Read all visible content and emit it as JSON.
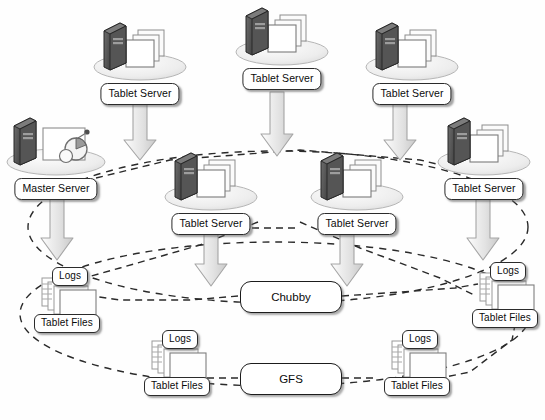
{
  "diagram": {
    "palette": {
      "arrow_fill": "#e6e6e6",
      "arrow_edge": "#9a9a9a",
      "dash_stroke": "#2a2a2a",
      "box_border": "#1c1c1c",
      "box_fill": "#ffffff",
      "tower_dark": "#3a3a3a",
      "ellipse_base": "#e9e9e9",
      "page_fill": "#fdfdfd",
      "page_edge": "#8d8d8d"
    },
    "nodes": [
      {
        "id": "ts1",
        "label": "Tablet Server",
        "icon": "tablet-server-icon",
        "x": 86,
        "y": 17,
        "kind": "server"
      },
      {
        "id": "ts2",
        "label": "Tablet Server",
        "icon": "tablet-server-icon",
        "x": 228,
        "y": 2,
        "kind": "server"
      },
      {
        "id": "ts3",
        "label": "Tablet Server",
        "icon": "tablet-server-icon",
        "x": 358,
        "y": 17,
        "kind": "server"
      },
      {
        "id": "ms",
        "label": "Master Server",
        "icon": "master-server-icon",
        "x": 0,
        "y": 112,
        "kind": "master"
      },
      {
        "id": "ts4",
        "label": "Tablet Server",
        "icon": "tablet-server-icon",
        "x": 157,
        "y": 147,
        "kind": "server"
      },
      {
        "id": "ts5",
        "label": "Tablet Server",
        "icon": "tablet-server-icon",
        "x": 303,
        "y": 147,
        "kind": "server"
      },
      {
        "id": "ts6",
        "label": "Tablet Server",
        "icon": "tablet-server-icon",
        "x": 430,
        "y": 112,
        "kind": "server"
      },
      {
        "id": "tf1",
        "label": "Tablet Files",
        "sublabel": "Logs",
        "icon": "tablet-files-icon",
        "x": 30,
        "y": 267,
        "kind": "files"
      },
      {
        "id": "tf2",
        "label": "Tablet Files",
        "sublabel": "Logs",
        "icon": "tablet-files-icon",
        "x": 140,
        "y": 330,
        "kind": "files"
      },
      {
        "id": "tf3",
        "label": "Tablet Files",
        "sublabel": "Logs",
        "icon": "tablet-files-icon",
        "x": 380,
        "y": 330,
        "kind": "files"
      },
      {
        "id": "tf4",
        "label": "Tablet Files",
        "sublabel": "Logs",
        "icon": "tablet-files-icon",
        "x": 468,
        "y": 262,
        "kind": "files"
      }
    ],
    "services": [
      {
        "id": "chubby",
        "label": "Chubby",
        "x": 240,
        "y": 281,
        "w": 100,
        "h": 30
      },
      {
        "id": "gfs",
        "label": "GFS",
        "x": 240,
        "y": 363,
        "w": 100,
        "h": 30
      }
    ],
    "groups": [
      {
        "id": "server-cluster-boundary",
        "label": "",
        "kind": "dashed-ellipse",
        "cx": 278,
        "cy": 227,
        "rx": 250,
        "ry": 76
      },
      {
        "id": "storage-boundary",
        "label": "",
        "kind": "dashed-ellipse",
        "cx": 275,
        "cy": 314,
        "rx": 255,
        "ry": 72
      }
    ],
    "arrows": [
      {
        "id": "ts1-down",
        "from": "ts1",
        "to": "ts4",
        "x": 140,
        "y": 104,
        "h": 54
      },
      {
        "id": "ts2-down",
        "from": "ts2",
        "to": "ts5",
        "x": 277,
        "y": 92,
        "h": 62
      },
      {
        "id": "ts3-down",
        "from": "ts3",
        "to": "ts6",
        "x": 400,
        "y": 104,
        "h": 54
      },
      {
        "id": "ms-down",
        "from": "ms",
        "to": "tf1",
        "x": 57,
        "y": 198,
        "h": 62
      },
      {
        "id": "ts4-down",
        "from": "ts4",
        "to": "chubby",
        "x": 211,
        "y": 232,
        "h": 54
      },
      {
        "id": "ts5-down",
        "from": "ts5",
        "to": "chubby",
        "x": 347,
        "y": 232,
        "h": 54
      },
      {
        "id": "ts6-down",
        "from": "ts6",
        "to": "tf4",
        "x": 483,
        "y": 198,
        "h": 62
      }
    ],
    "links": [
      {
        "id": "ms-to-ts6",
        "from": "ms",
        "to": "ts6",
        "style": "dashed"
      },
      {
        "id": "ts4-to-ts5",
        "from": "ts4",
        "to": "ts5",
        "style": "dashed"
      },
      {
        "id": "ts4-to-tf1",
        "from": "ts4",
        "to": "tf1",
        "style": "dashed"
      },
      {
        "id": "ts5-to-tf4",
        "from": "ts5",
        "to": "tf4",
        "style": "dashed"
      },
      {
        "id": "chubby-left",
        "from": "chubby",
        "to": "tf1",
        "style": "dashed"
      },
      {
        "id": "chubby-right",
        "from": "chubby",
        "to": "tf4",
        "style": "dashed"
      },
      {
        "id": "gfs-left",
        "from": "gfs",
        "to": "tf2",
        "style": "dashed"
      },
      {
        "id": "gfs-right",
        "from": "gfs",
        "to": "tf3",
        "style": "dashed"
      }
    ]
  }
}
